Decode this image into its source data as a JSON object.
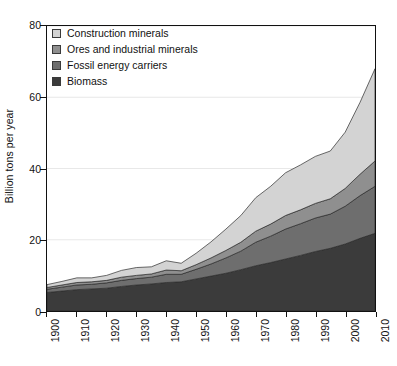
{
  "chart_data": {
    "type": "area",
    "stacked": true,
    "title": "",
    "subtitle": "",
    "xlabel": "",
    "ylabel": "Billion tons per year",
    "xlim": [
      1900,
      2010
    ],
    "ylim": [
      0,
      80
    ],
    "grid": true,
    "grid_axis": "y",
    "legend_position": "top-left",
    "x_tick_labels": [
      "1900",
      "1910",
      "1920",
      "1930",
      "1940",
      "1950",
      "1960",
      "1970",
      "1980",
      "1990",
      "2000",
      "2010"
    ],
    "y_tick_labels": [
      "0",
      "20",
      "40",
      "60",
      "80"
    ],
    "y_ticks": [
      0,
      20,
      40,
      60,
      80
    ],
    "x_tick_rotation": -90,
    "x": [
      1900,
      1905,
      1910,
      1915,
      1920,
      1925,
      1930,
      1935,
      1940,
      1945,
      1950,
      1955,
      1960,
      1965,
      1970,
      1975,
      1980,
      1985,
      1990,
      1995,
      2000,
      2005,
      2010
    ],
    "series": [
      {
        "name": "Biomass",
        "color": "#3b3b3b",
        "stack_order": 1,
        "values": [
          5.2,
          5.6,
          6.0,
          6.2,
          6.4,
          6.9,
          7.3,
          7.6,
          8.0,
          8.2,
          9.0,
          9.8,
          10.6,
          11.6,
          12.7,
          13.6,
          14.6,
          15.6,
          16.7,
          17.6,
          18.8,
          20.4,
          21.8
        ]
      },
      {
        "name": "Fossil energy carriers",
        "color": "#6e6e6e",
        "stack_order": 2,
        "values": [
          0.9,
          1.1,
          1.3,
          1.3,
          1.5,
          1.7,
          1.8,
          1.9,
          2.3,
          2.1,
          2.7,
          3.4,
          4.3,
          5.2,
          6.6,
          7.4,
          8.4,
          8.9,
          9.4,
          9.6,
          10.6,
          12.0,
          13.2
        ]
      },
      {
        "name": "Ores and industrial minerals",
        "color": "#8f8f8f",
        "stack_order": 3,
        "values": [
          0.5,
          0.6,
          0.7,
          0.7,
          0.7,
          0.9,
          0.9,
          0.9,
          1.2,
          1.0,
          1.3,
          1.7,
          2.1,
          2.5,
          3.1,
          3.4,
          3.8,
          3.9,
          4.1,
          4.3,
          5.0,
          6.0,
          7.1
        ]
      },
      {
        "name": "Construction minerals",
        "color": "#d3d3d3",
        "stack_order": 4,
        "values": [
          0.8,
          1.0,
          1.3,
          1.1,
          1.4,
          1.9,
          2.2,
          2.0,
          2.6,
          2.1,
          3.2,
          4.5,
          6.0,
          7.5,
          9.4,
          10.6,
          12.0,
          12.6,
          13.2,
          13.4,
          15.8,
          20.2,
          25.9
        ]
      }
    ],
    "totals": [
      7.4,
      8.3,
      9.3,
      9.3,
      10.0,
      11.4,
      12.2,
      12.4,
      14.1,
      13.4,
      16.2,
      19.4,
      23.0,
      26.8,
      31.8,
      35.0,
      38.8,
      41.0,
      43.4,
      44.9,
      50.2,
      58.6,
      68.0
    ]
  },
  "legend": {
    "items": [
      {
        "label": "Construction minerals",
        "color": "#d3d3d3"
      },
      {
        "label": "Ores and industrial minerals",
        "color": "#8f8f8f"
      },
      {
        "label": "Fossil energy carriers",
        "color": "#6e6e6e"
      },
      {
        "label": "Biomass",
        "color": "#3b3b3b"
      }
    ]
  },
  "axes": {
    "y_title": "Billion tons per year"
  }
}
